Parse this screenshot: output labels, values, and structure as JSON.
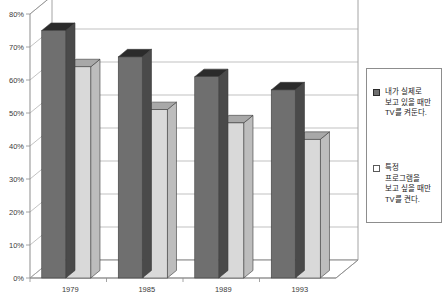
{
  "chart_data": {
    "type": "bar",
    "title": "",
    "subtitle": "",
    "xlabel": "",
    "ylabel": "",
    "categories": [
      "1979",
      "1985",
      "1989",
      "1993"
    ],
    "ylim": [
      0,
      80
    ],
    "ytick_values": [
      0,
      10,
      20,
      30,
      40,
      50,
      60,
      70,
      80
    ],
    "ytick_labels": [
      "0%",
      "10%",
      "20%",
      "30%",
      "40%",
      "50%",
      "60%",
      "70%",
      "80%"
    ],
    "grid": true,
    "legend_position": "right",
    "three_d": true,
    "series": [
      {
        "name": "내가 실제로\n보고 있을 때만\nTV를 켜둔다.",
        "color": "#6f6f6f",
        "values": [
          75,
          67,
          61,
          57
        ]
      },
      {
        "name": "특정\n프로그램을\n보고 싶을 때만\nTV를 켠다.",
        "color": "#d9d9d9",
        "values": [
          64,
          51,
          47,
          42
        ]
      }
    ]
  },
  "legend": {
    "entries": [
      {
        "label": "내가 실제로\n보고 있을 때만\nTV를 켜둔다.",
        "swatch": "dark"
      },
      {
        "label": "특정\n프로그램을\n보고 싶을 때만\nTV를 켠다.",
        "swatch": "light"
      }
    ]
  },
  "colors": {
    "series_dark": "#6f6f6f",
    "series_dark_top": "#2b2b2b",
    "series_dark_side": "#4a4a4a",
    "series_light": "#d9d9d9",
    "series_light_top": "#a8a8a8",
    "series_light_side": "#bdbdbd",
    "axis": "#8d8d8d",
    "grid": "#a8a8a8",
    "text": "#3a3a3a",
    "background": "#ffffff"
  }
}
